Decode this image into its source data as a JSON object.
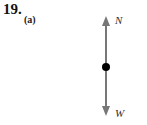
{
  "problem": {
    "number": "19.",
    "part": "(a)"
  },
  "diagram": {
    "type": "free-body",
    "forces": [
      {
        "label": "N",
        "direction": "up"
      },
      {
        "label": "W",
        "direction": "down"
      }
    ],
    "arrow_color": "#777777",
    "dot_color": "#000000"
  }
}
